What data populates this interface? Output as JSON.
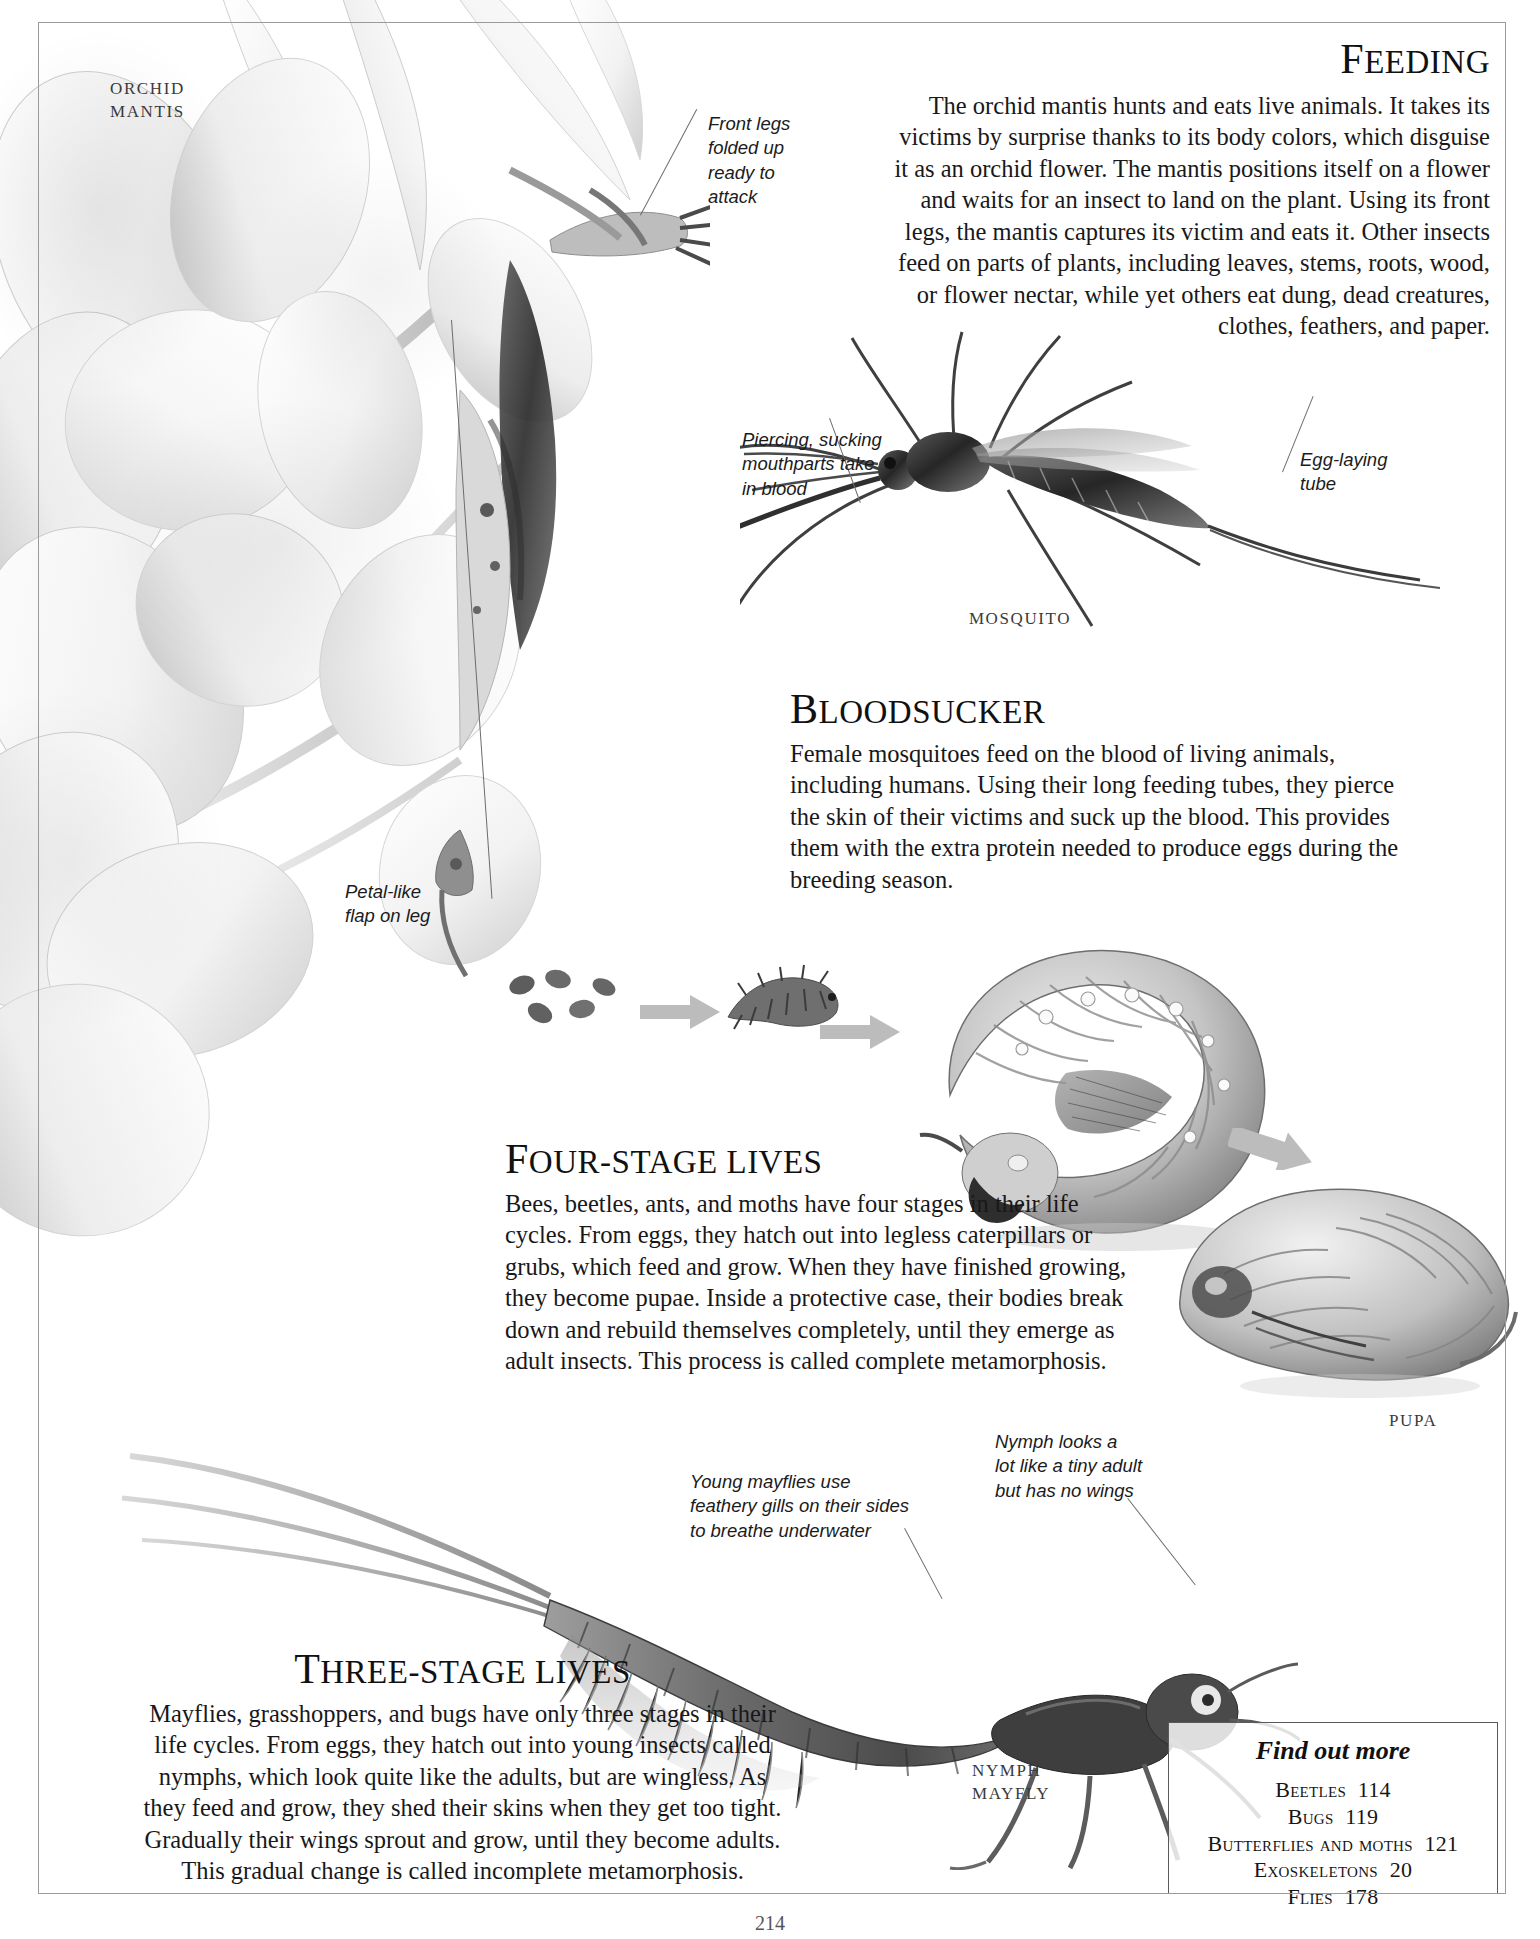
{
  "page": {
    "folio": "214",
    "specimen_labels": {
      "orchid_mantis": "ORCHID\nMANTIS",
      "orchid_mantis_line1": "ORCHID",
      "orchid_mantis_line2": "MANTIS",
      "mosquito": "MOSQUITO",
      "pupa": "PUPA",
      "nymph": "NYMPH",
      "mayfly": "MAYFLY"
    }
  },
  "sections": {
    "feeding": {
      "heading_cap": "F",
      "heading_rest": "EEDING",
      "heading_full": "FEEDING",
      "body": "The orchid mantis hunts and eats live animals. It takes its victims by surprise thanks to its body colors, which disguise it as an orchid flower. The mantis positions itself on a flower and waits for an insect to land on the plant. Using its front legs, the mantis captures its victim and eats it. Other insects feed on parts of plants, including leaves, stems, roots, wood, or flower nectar, while yet others eat dung, dead creatures, clothes, feathers, and paper."
    },
    "bloodsucker": {
      "heading_cap": "B",
      "heading_rest": "LOODSUCKER",
      "heading_full": "BLOODSUCKER",
      "body": "Female mosquitoes feed on the blood of living animals, including humans. Using their long feeding tubes, they pierce the skin of their victims and suck up the blood. This provides them with the extra protein needed to produce eggs during the breeding season."
    },
    "four_stage": {
      "heading_cap": "F",
      "heading_rest": "OUR-",
      "heading_tail": "STAGE LIVES",
      "heading_full": "FOUR-STAGE LIVES",
      "body": "Bees, beetles, ants, and moths have four stages in their life cycles. From eggs, they hatch out into legless caterpillars or grubs, which feed and grow. When they have finished growing, they become pupae. Inside a protective case, their bodies break down and rebuild themselves completely, until they emerge as adult insects. This process is called complete metamorphosis."
    },
    "three_stage": {
      "heading_cap": "T",
      "heading_rest": "HREE-",
      "heading_tail": "STAGE LIVES",
      "heading_full": "THREE-STAGE LIVES",
      "body": "Mayflies, grasshoppers, and bugs have only three stages in their life cycles. From eggs, they hatch out into young insects called nymphs, which look quite like the adults, but are wingless. As they feed and grow, they shed their skins when they get too tight. Gradually their wings sprout and grow, until they become adults. This gradual change is called incomplete metamorphosis."
    }
  },
  "callouts": {
    "front_legs": "Front legs\nfolded up\nready to\nattack",
    "front_legs_text": "Front legs folded up ready to attack",
    "mouthparts": "Piercing, sucking\nmouthparts take\nin blood",
    "mouthparts_text": "Piercing, sucking mouthparts take in blood",
    "egg_tube": "Egg-laying\ntube",
    "egg_tube_text": "Egg-laying tube",
    "petal_flap": "Petal-like\nflap on leg",
    "petal_flap_text": "Petal-like flap on leg",
    "gills": "Young mayflies use\nfeathery gills on their sides\nto breathe underwater",
    "gills_text": "Young mayflies use feathery gills on their sides to breathe underwater",
    "nymph_wings": "Nymph looks a\nlot like a tiny adult\nbut has no wings",
    "nymph_wings_text": "Nymph looks a lot like a tiny adult but has no wings"
  },
  "find_out_more": {
    "title": "Find out more",
    "entries": [
      {
        "name": "Beetles",
        "page": "114"
      },
      {
        "name": "Bugs",
        "page": "119"
      },
      {
        "name": "Butterflies and moths",
        "page": "121"
      },
      {
        "name": "Exoskeletons",
        "page": "20"
      },
      {
        "name": "Flies",
        "page": "178"
      }
    ]
  },
  "life_cycle": {
    "stages": [
      "eggs",
      "larva",
      "caterpillar",
      "pupa"
    ],
    "arrow_color": "#b9b9b9"
  },
  "colors": {
    "ink": "#18181a",
    "rule": "#9a9a9a",
    "leader": "#6d6d6d",
    "label": "#3a3a3a",
    "box_border": "#5a5a5a"
  }
}
